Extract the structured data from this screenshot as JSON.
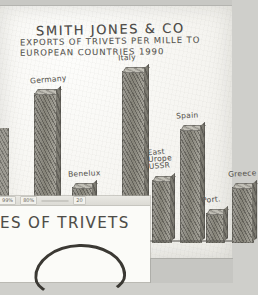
{
  "document": {
    "type": "hand-drawn pencil bar chart on paper",
    "title": "SMITH JONES & CO",
    "subtitle_line1": "EXPORTS OF TRIVETS PER MILLE TO",
    "subtitle_line2": "EUROPEAN COUNTRIES  1990"
  },
  "overlay_panel": {
    "heading": "ES OF TRIVETS",
    "toolbar_chips": [
      "99%",
      "80%",
      "",
      "20"
    ],
    "doodle_name": "hand-drawn arch doodle"
  },
  "colors": {
    "paper": "#f6f5f1",
    "pencil": "#55534e",
    "bar_fill": "#8a8881",
    "desktop": "#cfcfcb",
    "panel": "#fbfbf8"
  },
  "chart_data": {
    "type": "bar",
    "xlabel": "",
    "ylabel": "",
    "grid": false,
    "legend": "none",
    "ylim": [
      0,
      100
    ],
    "categories": [
      "Germany",
      "Benelux",
      "Sweden",
      "Italy",
      "East Europe USSR",
      "Spain",
      "Portugal",
      "Greece"
    ],
    "values": [
      82,
      30,
      12,
      94,
      34,
      62,
      16,
      30
    ],
    "bars": [
      {
        "label": "Germany",
        "value": 82,
        "x": 34,
        "width": 22
      },
      {
        "label": "Benelux",
        "value": 30,
        "x": 72,
        "width": 20
      },
      {
        "label": "Sweden",
        "value": 12,
        "x": 98,
        "width": 16
      },
      {
        "label": "Italy",
        "value": 94,
        "x": 122,
        "width": 22
      },
      {
        "label": "East Europe USSR",
        "value": 34,
        "x": 152,
        "width": 18
      },
      {
        "label": "Spain",
        "value": 62,
        "x": 180,
        "width": 20
      },
      {
        "label": "Portugal",
        "value": 16,
        "x": 206,
        "width": 17
      },
      {
        "label": "Greece",
        "value": 30,
        "x": 232,
        "width": 20
      }
    ]
  }
}
